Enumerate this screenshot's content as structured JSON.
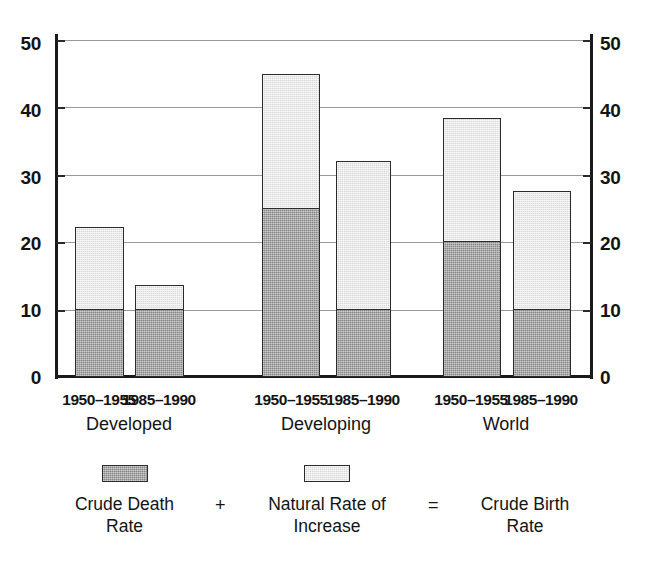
{
  "chart_data": {
    "type": "bar",
    "title": "",
    "subtitle": "",
    "xlabel": "",
    "ylabel": "",
    "stacked": true,
    "grid": true,
    "ylim": [
      0,
      50
    ],
    "yticks": [
      0,
      10,
      20,
      30,
      40,
      50
    ],
    "ytick_labels_left": [
      "50",
      "40",
      "30",
      "20",
      "10",
      "0"
    ],
    "ytick_labels_right": [
      "50",
      "40",
      "30",
      "20",
      "10",
      "0"
    ],
    "dual_axis": true,
    "legend_position": "bottom",
    "groups": [
      {
        "name": "Developed",
        "periods": [
          "1950–1955",
          "1985–1990"
        ],
        "crude_death_rate": [
          10,
          10
        ],
        "natural_rate_of_increase": [
          12.2,
          3.6
        ],
        "crude_birth_rate": [
          22.2,
          13.6
        ]
      },
      {
        "name": "Developing",
        "periods": [
          "1950–1955",
          "1985–1990"
        ],
        "crude_death_rate": [
          25,
          10
        ],
        "natural_rate_of_increase": [
          20,
          22
        ],
        "crude_birth_rate": [
          45,
          32
        ]
      },
      {
        "name": "World",
        "periods": [
          "1950–1955",
          "1985–1990"
        ],
        "crude_death_rate": [
          20,
          10
        ],
        "natural_rate_of_increase": [
          18.4,
          17.6
        ],
        "crude_birth_rate": [
          38.4,
          27.6
        ]
      }
    ],
    "series": [
      {
        "name": "Crude Death Rate",
        "color": "#9b9b9b",
        "values": [
          10,
          10,
          25,
          10,
          20,
          10
        ]
      },
      {
        "name": "Natural Rate of Increase",
        "color": "#e6e6e6",
        "values": [
          12.2,
          3.6,
          20,
          22,
          18.4,
          17.6
        ]
      }
    ],
    "categories": [
      "Developed 1950–1955",
      "Developed 1985–1990",
      "Developing 1950–1955",
      "Developing 1985–1990",
      "World 1950–1955",
      "World 1985–1990"
    ],
    "colors": {
      "dark_fill": "#9b9b9b",
      "light_fill": "#e6e6e6",
      "outline": "#2b2b2b",
      "gridline": "#9a9a9a",
      "axis": "#1a1a1a",
      "text": "#141414",
      "background": "#ffffff"
    }
  },
  "axis": {
    "left_labels": [
      "50",
      "40",
      "30",
      "20",
      "10",
      "0"
    ],
    "right_labels": [
      "50",
      "40",
      "30",
      "20",
      "10",
      "0"
    ]
  },
  "bars": [
    {
      "period": "1950–1955",
      "group": "Developed",
      "death": 10,
      "increase": 12.2,
      "total": 22.2
    },
    {
      "period": "1985–1990",
      "group": "Developed",
      "death": 10,
      "increase": 3.6,
      "total": 13.6
    },
    {
      "period": "1950–1955",
      "group": "Developing",
      "death": 25,
      "increase": 20,
      "total": 45
    },
    {
      "period": "1985–1990",
      "group": "Developing",
      "death": 10,
      "increase": 22,
      "total": 32
    },
    {
      "period": "1950–1955",
      "group": "World",
      "death": 20,
      "increase": 18.4,
      "total": 38.4
    },
    {
      "period": "1985–1990",
      "group": "World",
      "death": 10,
      "increase": 17.6,
      "total": 27.6
    }
  ],
  "x_axis": {
    "periods": [
      "1950–1955",
      "1985–1990",
      "1950–1955",
      "1985–1990",
      "1950–1955",
      "1985–1990"
    ],
    "groups": [
      "Developed",
      "Developing",
      "World"
    ]
  },
  "legend": {
    "entries": [
      {
        "label": "Crude Death\nRate",
        "swatch": "dark"
      },
      {
        "label": "Natural Rate of\nIncrease",
        "swatch": "light"
      },
      {
        "label": "Crude Birth\nRate",
        "swatch": "none"
      }
    ],
    "operators": [
      "+",
      "="
    ]
  }
}
